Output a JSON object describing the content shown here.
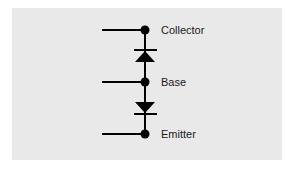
{
  "diagram": {
    "terminals": [
      {
        "label": "Collector"
      },
      {
        "label": "Base"
      },
      {
        "label": "Emitter"
      }
    ],
    "colors": {
      "background": "#e9e9e9",
      "stroke": "#000000",
      "text": "#1a1a1a"
    }
  }
}
